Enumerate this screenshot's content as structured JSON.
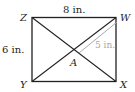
{
  "diagram": {
    "type": "rectangle-with-diagonals",
    "vertices": {
      "top_left": "Z",
      "top_right": "W",
      "bottom_left": "Y",
      "bottom_right": "X",
      "center": "A"
    },
    "measurements": {
      "top_side": "8 in.",
      "left_side": "6 in.",
      "half_diagonal": "5 in."
    },
    "colors": {
      "lines": "#231f20",
      "measure_line": "#a7a9ac"
    }
  }
}
